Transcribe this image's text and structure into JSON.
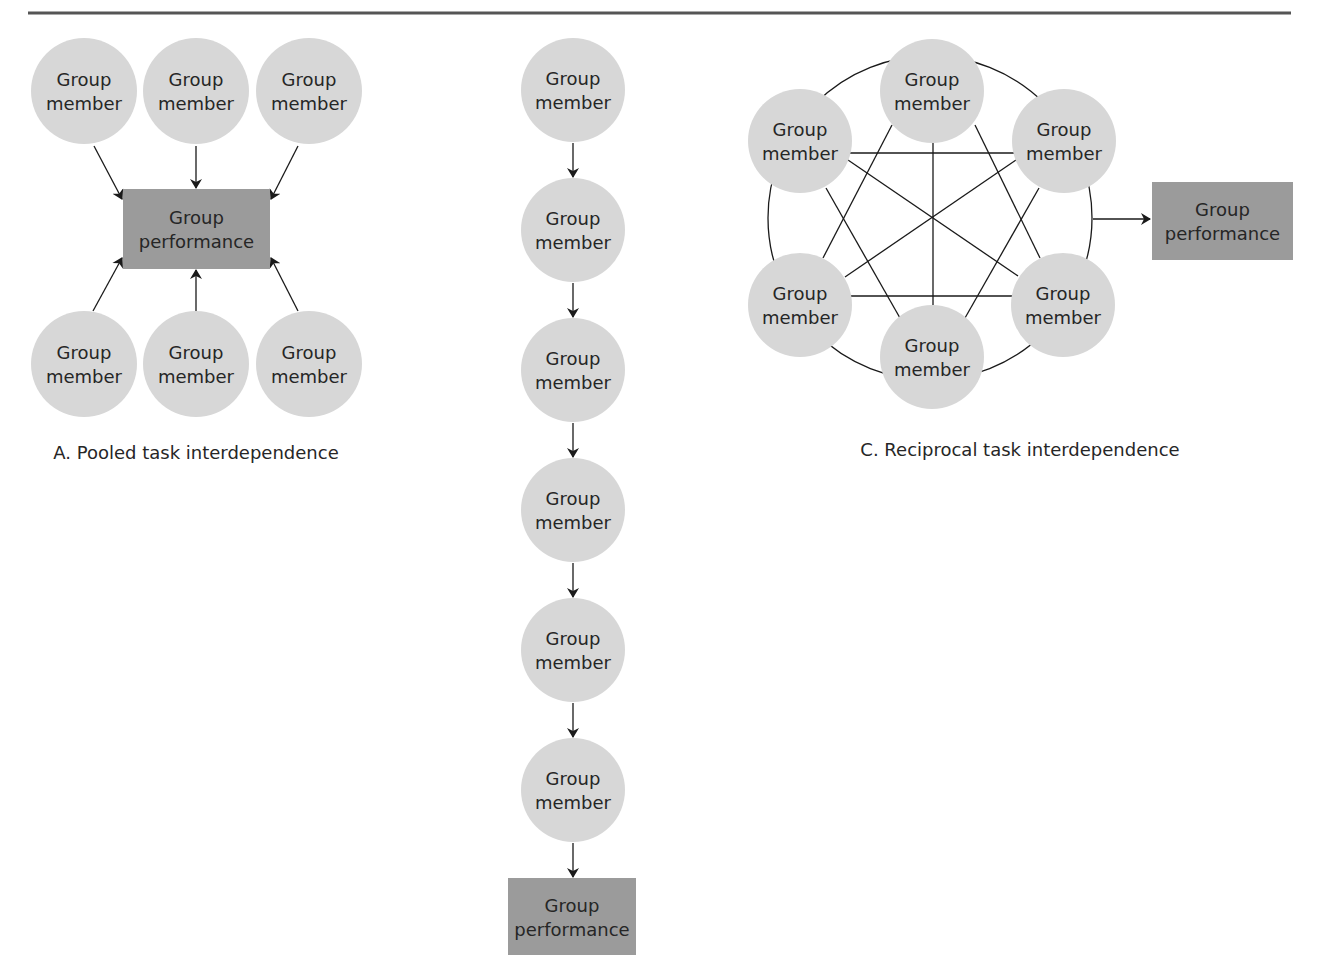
{
  "colors": {
    "rule": "#555555",
    "member_fill": "#d7d7d7",
    "performance_fill": "#9b9b9b",
    "line": "#1a1a1a",
    "text": "#262626"
  },
  "top_rule": {
    "x1": 28,
    "x2": 1291,
    "y": 13
  },
  "labels": {
    "member_line1": "Group",
    "member_line2": "member",
    "performance_line1": "Group",
    "performance_line2": "performance"
  },
  "diagrams": [
    {
      "id": "pooled",
      "caption": "A. Pooled task interdependence",
      "caption_pos": {
        "x": 196,
        "y": 459
      },
      "members": [
        {
          "cx": 84,
          "cy": 91,
          "r": 53
        },
        {
          "cx": 196,
          "cy": 91,
          "r": 53
        },
        {
          "cx": 309,
          "cy": 91,
          "r": 53
        },
        {
          "cx": 84,
          "cy": 364,
          "r": 53
        },
        {
          "cx": 196,
          "cy": 364,
          "r": 53
        },
        {
          "cx": 309,
          "cy": 364,
          "r": 53
        }
      ],
      "performance": {
        "x": 123,
        "y": 189,
        "w": 147,
        "h": 80
      },
      "arrows": [
        {
          "x1": 94,
          "y1": 146,
          "x2": 122,
          "y2": 199
        },
        {
          "x1": 196,
          "y1": 146,
          "x2": 196,
          "y2": 188
        },
        {
          "x1": 298,
          "y1": 146,
          "x2": 271,
          "y2": 199
        },
        {
          "x1": 93,
          "y1": 311,
          "x2": 122,
          "y2": 258
        },
        {
          "x1": 196,
          "y1": 311,
          "x2": 196,
          "y2": 270
        },
        {
          "x1": 298,
          "y1": 311,
          "x2": 271,
          "y2": 258
        }
      ]
    },
    {
      "id": "sequential",
      "caption": "",
      "members": [
        {
          "cx": 573,
          "cy": 90,
          "r": 52
        },
        {
          "cx": 573,
          "cy": 230,
          "r": 52
        },
        {
          "cx": 573,
          "cy": 370,
          "r": 52
        },
        {
          "cx": 573,
          "cy": 510,
          "r": 52
        },
        {
          "cx": 573,
          "cy": 650,
          "r": 52
        },
        {
          "cx": 573,
          "cy": 790,
          "r": 52
        }
      ],
      "performance": {
        "x": 508,
        "y": 878,
        "w": 128,
        "h": 77
      },
      "arrows": [
        {
          "x1": 573,
          "y1": 143,
          "x2": 573,
          "y2": 177
        },
        {
          "x1": 573,
          "y1": 283,
          "x2": 573,
          "y2": 317
        },
        {
          "x1": 573,
          "y1": 423,
          "x2": 573,
          "y2": 457
        },
        {
          "x1": 573,
          "y1": 563,
          "x2": 573,
          "y2": 597
        },
        {
          "x1": 573,
          "y1": 703,
          "x2": 573,
          "y2": 737
        },
        {
          "x1": 573,
          "y1": 843,
          "x2": 573,
          "y2": 877
        }
      ]
    },
    {
      "id": "reciprocal",
      "caption": "C. Reciprocal task interdependence",
      "caption_pos": {
        "x": 1020,
        "y": 456
      },
      "ring": {
        "cx": 930,
        "cy": 218,
        "r": 162
      },
      "members": [
        {
          "cx": 932,
          "cy": 91,
          "r": 52
        },
        {
          "cx": 800,
          "cy": 141,
          "r": 52
        },
        {
          "cx": 1064,
          "cy": 141,
          "r": 52
        },
        {
          "cx": 800,
          "cy": 305,
          "r": 52
        },
        {
          "cx": 1063,
          "cy": 305,
          "r": 52
        },
        {
          "cx": 932,
          "cy": 357,
          "r": 52
        }
      ],
      "connections": [
        {
          "x1": 848,
          "y1": 153,
          "x2": 1016,
          "y2": 153
        },
        {
          "x1": 848,
          "y1": 296,
          "x2": 1016,
          "y2": 296
        },
        {
          "x1": 933,
          "y1": 143,
          "x2": 933,
          "y2": 305
        },
        {
          "x1": 848,
          "y1": 160,
          "x2": 1018,
          "y2": 276
        },
        {
          "x1": 1016,
          "y1": 160,
          "x2": 845,
          "y2": 277
        },
        {
          "x1": 892,
          "y1": 125,
          "x2": 823,
          "y2": 258
        },
        {
          "x1": 975,
          "y1": 125,
          "x2": 1040,
          "y2": 258
        },
        {
          "x1": 826,
          "y1": 188,
          "x2": 900,
          "y2": 318
        },
        {
          "x1": 1039,
          "y1": 188,
          "x2": 965,
          "y2": 318
        }
      ],
      "performance": {
        "x": 1152,
        "y": 182,
        "w": 141,
        "h": 78
      },
      "arrows": [
        {
          "x1": 1093,
          "y1": 219,
          "x2": 1150,
          "y2": 219
        }
      ]
    }
  ]
}
